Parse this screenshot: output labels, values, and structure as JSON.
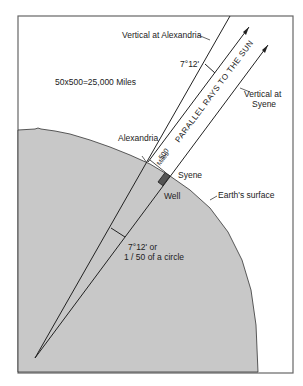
{
  "diagram": {
    "labels": {
      "vertical_alexandria": "Vertical at Alexandria",
      "angle_top": "7°12'",
      "formula": "50x500=25,000 Miles",
      "parallel_rays": "PARALLEL RAYS TO THE SUN",
      "vertical_syene_line1": "Vertical at",
      "vertical_syene_line2": "Syene",
      "alexandria": "Alexandria",
      "distance_value": "500",
      "distance_unit": "Miles",
      "syene": "Syene",
      "well": "Well",
      "earths_surface": "Earth's surface",
      "angle_center_line1": "7°12' or",
      "angle_center_line2": "1 / 50 of a circle"
    },
    "colors": {
      "earth_fill": "#c8c8c8",
      "line": "#222222",
      "frame": "#666666",
      "background": "#ffffff"
    }
  }
}
